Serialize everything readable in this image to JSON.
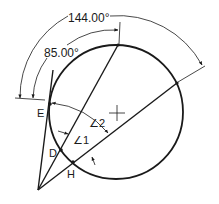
{
  "figure": {
    "dimensions": {
      "outer_arc": "144.00°",
      "inner_arc": "85.00°"
    },
    "points": {
      "E": "E",
      "D": "D",
      "H": "H"
    },
    "angles": {
      "angle1": "∠1",
      "angle2": "∠2"
    },
    "colors": {
      "stroke": "#1a1a1a",
      "background": "#ffffff"
    }
  }
}
